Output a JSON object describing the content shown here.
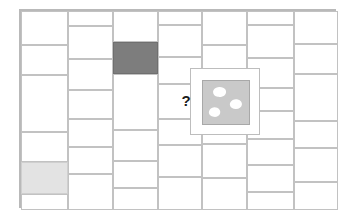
{
  "figure": {
    "width": 354,
    "height": 218,
    "background": "#ffffff",
    "frame": {
      "x": 19,
      "y": 9,
      "width": 317,
      "height": 199,
      "border_color": "#b9b9b9",
      "border_width": 2
    },
    "colors": {
      "tile_fill": "#ffffff",
      "tile_border": "#c2c2c2",
      "tile_dark": "#7d7d7d",
      "tile_light": "#e3e3e3",
      "panel_fill": "#ffffff",
      "panel_border": "#bdbdbd",
      "sample_fill": "#c9c9c9",
      "sample_border": "#a8a8a8",
      "blob_fill": "#ffffff",
      "marker_color": "#1b1b1b"
    },
    "columns": [
      {
        "index": 1,
        "x": 0,
        "width": 47,
        "tiles": [
          {
            "y": 0,
            "height": 34,
            "shade": "none"
          },
          {
            "y": 34,
            "height": 30,
            "shade": "none"
          },
          {
            "y": 64,
            "height": 57,
            "shade": "none"
          },
          {
            "y": 121,
            "height": 30,
            "shade": "none"
          },
          {
            "y": 151,
            "height": 32,
            "shade": "light"
          },
          {
            "y": 183,
            "height": 16,
            "shade": "none"
          }
        ]
      },
      {
        "index": 2,
        "x": 47,
        "width": 45,
        "tiles": [
          {
            "y": 0,
            "height": 15,
            "shade": "none"
          },
          {
            "y": 15,
            "height": 33,
            "shade": "none"
          },
          {
            "y": 48,
            "height": 31,
            "shade": "none"
          },
          {
            "y": 79,
            "height": 29,
            "shade": "none"
          },
          {
            "y": 108,
            "height": 28,
            "shade": "none"
          },
          {
            "y": 136,
            "height": 27,
            "shade": "none"
          },
          {
            "y": 163,
            "height": 36,
            "shade": "none"
          }
        ]
      },
      {
        "index": 3,
        "x": 92,
        "width": 45,
        "tiles": [
          {
            "y": 0,
            "height": 31,
            "shade": "none"
          },
          {
            "y": 31,
            "height": 32,
            "shade": "dark"
          },
          {
            "y": 63,
            "height": 56,
            "shade": "none"
          },
          {
            "y": 119,
            "height": 31,
            "shade": "none"
          },
          {
            "y": 150,
            "height": 27,
            "shade": "none"
          },
          {
            "y": 177,
            "height": 22,
            "shade": "none"
          }
        ]
      },
      {
        "index": 4,
        "x": 137,
        "width": 44,
        "tiles": [
          {
            "y": 0,
            "height": 14,
            "shade": "none"
          },
          {
            "y": 14,
            "height": 32,
            "shade": "none"
          },
          {
            "y": 46,
            "height": 27,
            "shade": "none"
          },
          {
            "y": 73,
            "height": 35,
            "shade": "none"
          },
          {
            "y": 108,
            "height": 26,
            "shade": "none"
          },
          {
            "y": 134,
            "height": 32,
            "shade": "none"
          },
          {
            "y": 166,
            "height": 33,
            "shade": "none"
          }
        ]
      },
      {
        "index": 5,
        "x": 181,
        "width": 45,
        "tiles": [
          {
            "y": 0,
            "height": 34,
            "shade": "none"
          },
          {
            "y": 34,
            "height": 31,
            "shade": "none"
          },
          {
            "y": 65,
            "height": 68,
            "shade": "none"
          },
          {
            "y": 133,
            "height": 34,
            "shade": "none"
          },
          {
            "y": 167,
            "height": 32,
            "shade": "none"
          }
        ]
      },
      {
        "index": 6,
        "x": 226,
        "width": 47,
        "tiles": [
          {
            "y": 0,
            "height": 14,
            "shade": "none"
          },
          {
            "y": 14,
            "height": 33,
            "shade": "none"
          },
          {
            "y": 47,
            "height": 30,
            "shade": "none"
          },
          {
            "y": 77,
            "height": 23,
            "shade": "none"
          },
          {
            "y": 100,
            "height": 28,
            "shade": "none"
          },
          {
            "y": 128,
            "height": 26,
            "shade": "none"
          },
          {
            "y": 154,
            "height": 27,
            "shade": "none"
          },
          {
            "y": 181,
            "height": 18,
            "shade": "none"
          }
        ]
      },
      {
        "index": 7,
        "x": 273,
        "width": 44,
        "tiles": [
          {
            "y": 0,
            "height": 33,
            "shade": "none"
          },
          {
            "y": 33,
            "height": 30,
            "shade": "none"
          },
          {
            "y": 63,
            "height": 47,
            "shade": "none"
          },
          {
            "y": 110,
            "height": 27,
            "shade": "none"
          },
          {
            "y": 137,
            "height": 34,
            "shade": "none"
          },
          {
            "y": 171,
            "height": 28,
            "shade": "none"
          }
        ]
      }
    ],
    "callout": {
      "label": "sample-detail-panel",
      "x": 190,
      "y": 68,
      "width": 70,
      "height": 67,
      "sample": {
        "label": "porous-material-sample",
        "blobs": [
          {
            "name": "blob-top-left"
          },
          {
            "name": "blob-middle-right"
          },
          {
            "name": "blob-bottom-left"
          }
        ]
      }
    },
    "marker": {
      "label": "question-marker",
      "text": "?",
      "x": 180,
      "y": 93
    }
  }
}
